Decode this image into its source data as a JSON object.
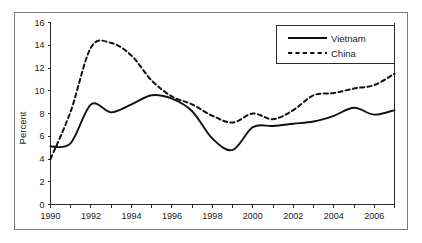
{
  "chart_data": {
    "type": "line",
    "title": "",
    "subtitle": "",
    "xlabel": "",
    "ylabel": "Percent",
    "xlim": [
      1990,
      2007
    ],
    "ylim": [
      0,
      16
    ],
    "y_ticks": [
      0,
      2,
      4,
      6,
      8,
      10,
      12,
      14,
      16
    ],
    "y_tick_labels": [
      "0",
      "2",
      "4",
      "6",
      "8",
      "10",
      "12",
      "14",
      "16"
    ],
    "x_ticks": [
      1990,
      1991,
      1992,
      1993,
      1994,
      1995,
      1996,
      1997,
      1998,
      1999,
      2000,
      2001,
      2002,
      2003,
      2004,
      2005,
      2006,
      2007
    ],
    "x_tick_labels": [
      "1990",
      "",
      "1992",
      "",
      "1994",
      "",
      "1996",
      "",
      "1998",
      "",
      "2000",
      "",
      "2002",
      "",
      "2004",
      "",
      "2006",
      ""
    ],
    "grid": false,
    "legend_position": "top-right",
    "x": [
      1990,
      1991,
      1992,
      1993,
      1994,
      1995,
      1996,
      1997,
      1998,
      1999,
      2000,
      2001,
      2002,
      2003,
      2004,
      2005,
      2006,
      2007
    ],
    "series": [
      {
        "name": "Vietnam",
        "style": "solid",
        "color": "#111111",
        "values": [
          5.1,
          5.4,
          8.8,
          8.1,
          8.8,
          9.6,
          9.3,
          8.2,
          5.8,
          4.8,
          6.8,
          6.9,
          7.1,
          7.3,
          7.8,
          8.5,
          7.9,
          8.3
        ]
      },
      {
        "name": "China",
        "style": "dashed",
        "color": "#111111",
        "values": [
          4.0,
          8.2,
          13.8,
          14.2,
          13.1,
          10.9,
          9.5,
          8.8,
          7.8,
          7.2,
          8.0,
          7.5,
          8.3,
          9.6,
          9.8,
          10.2,
          10.5,
          11.5
        ]
      }
    ]
  },
  "legend": {
    "entries": [
      {
        "label": "Vietnam",
        "style": "solid"
      },
      {
        "label": "China",
        "style": "dashed"
      }
    ]
  }
}
